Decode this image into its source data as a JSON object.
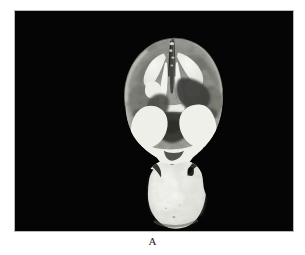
{
  "figure": {
    "caption": "A",
    "panel_background": "#050505",
    "page_background": "#ffffff",
    "border_color": "#b9b9b9",
    "modality_label": "coronal-brain-section"
  },
  "image_panel": {
    "x": 14,
    "y": 10,
    "width": 280,
    "height": 222
  },
  "specimen": {
    "name": "coronal brain section",
    "tissue_tones": {
      "bright_white": "#f2f2ee",
      "white_matter": "#e8e8e2",
      "light_gray": "#c2c2bc",
      "mid_gray": "#8e8e88",
      "dark_gray": "#5a5a56",
      "very_dark": "#2e2e2c",
      "background": "#050505"
    },
    "regions": [
      {
        "id": "cerebrum",
        "label": "cerebral hemispheres",
        "tone": "mid_gray"
      },
      {
        "id": "lateral-ventricles",
        "label": "lateral ventricles",
        "tone": "bright_white"
      },
      {
        "id": "midline-fissure",
        "label": "interhemispheric fissure",
        "tone": "very_dark"
      },
      {
        "id": "thalamus",
        "label": "thalamic / deep gray nuclei",
        "tone": "dark_gray"
      },
      {
        "id": "temporal-lobe-left",
        "label": "left temporal white matter",
        "tone": "bright_white"
      },
      {
        "id": "temporal-lobe-right",
        "label": "right temporal white matter",
        "tone": "bright_white"
      },
      {
        "id": "brainstem",
        "label": "brainstem / cerebellum",
        "tone": "bright_white"
      }
    ]
  }
}
